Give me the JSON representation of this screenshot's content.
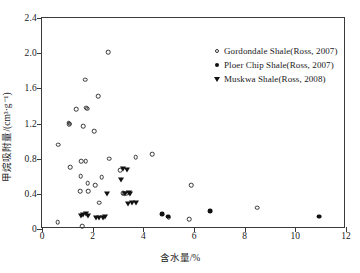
{
  "chart_data": {
    "type": "scatter",
    "title": "",
    "xlabel": "含水量/%",
    "ylabel": "甲烷吸附量/(cm³·g⁻¹)",
    "xlim": [
      0,
      12
    ],
    "ylim": [
      0,
      2.4
    ],
    "xticks": [
      "0",
      "2",
      "4",
      "6",
      "8",
      "10",
      "12"
    ],
    "xtick_values": [
      0,
      2,
      4,
      6,
      8,
      10,
      12
    ],
    "yticks": [
      "0",
      "0.4",
      "0.8",
      "1.2",
      "1.6",
      "2.0",
      "2.4"
    ],
    "ytick_values": [
      0,
      0.4,
      0.8,
      1.2,
      1.6,
      2.0,
      2.4
    ],
    "grid": false,
    "legend_position": "top-right",
    "series": [
      {
        "name": "Gordondale Shale(Ross, 2007)",
        "marker": "open-circle",
        "color": "#333333",
        "points": [
          [
            0.62,
            0.08
          ],
          [
            0.63,
            0.96
          ],
          [
            1.05,
            1.21
          ],
          [
            1.08,
            1.19
          ],
          [
            1.1,
            1.2
          ],
          [
            1.12,
            0.7
          ],
          [
            1.35,
            1.36
          ],
          [
            1.5,
            0.43
          ],
          [
            1.52,
            0.6
          ],
          [
            1.55,
            0.77
          ],
          [
            1.58,
            0.03
          ],
          [
            1.62,
            1.17
          ],
          [
            1.7,
            1.7
          ],
          [
            1.72,
            0.77
          ],
          [
            1.74,
            1.38
          ],
          [
            1.78,
            1.37
          ],
          [
            1.8,
            0.52
          ],
          [
            1.82,
            0.43
          ],
          [
            2.05,
            1.11
          ],
          [
            2.1,
            0.5
          ],
          [
            2.22,
            1.51
          ],
          [
            2.25,
            0.3
          ],
          [
            2.35,
            0.59
          ],
          [
            2.62,
            2.01
          ],
          [
            2.65,
            0.8
          ],
          [
            3.08,
            0.67
          ],
          [
            3.18,
            0.41
          ],
          [
            3.22,
            0.41
          ],
          [
            3.35,
            0.41
          ],
          [
            3.7,
            0.82
          ],
          [
            4.35,
            0.85
          ],
          [
            5.0,
            0.13
          ],
          [
            5.8,
            0.11
          ],
          [
            5.9,
            0.5
          ],
          [
            8.5,
            0.24
          ]
        ]
      },
      {
        "name": "Ploer Chip Shale(Ross, 2007)",
        "marker": "filled-circle",
        "color": "#111111",
        "points": [
          [
            4.75,
            0.17
          ],
          [
            4.98,
            0.14
          ],
          [
            6.65,
            0.2
          ],
          [
            10.95,
            0.14
          ]
        ]
      },
      {
        "name": "Muskwa Shale(Ross, 2008)",
        "marker": "filled-triangle-down",
        "color": "#111111",
        "points": [
          [
            1.55,
            0.15
          ],
          [
            1.62,
            0.16
          ],
          [
            1.72,
            0.17
          ],
          [
            1.8,
            0.15
          ],
          [
            2.15,
            0.13
          ],
          [
            2.25,
            0.12
          ],
          [
            2.42,
            0.12
          ],
          [
            2.5,
            0.14
          ],
          [
            2.55,
            0.4
          ],
          [
            3.1,
            0.56
          ],
          [
            3.18,
            0.68
          ],
          [
            3.28,
            0.4
          ],
          [
            3.35,
            0.67
          ],
          [
            3.4,
            0.29
          ],
          [
            3.45,
            0.41
          ],
          [
            3.48,
            0.4
          ],
          [
            3.55,
            0.3
          ],
          [
            3.7,
            0.3
          ]
        ]
      }
    ]
  },
  "legend": {
    "entries": [
      {
        "label": "Gordondale Shale(Ross, 2007)",
        "marker": "open-circle"
      },
      {
        "label": "Ploer Chip Shale(Ross, 2007)",
        "marker": "filled-circle"
      },
      {
        "label": "Muskwa Shale(Ross, 2008)",
        "marker": "filled-triangle-down"
      }
    ]
  }
}
